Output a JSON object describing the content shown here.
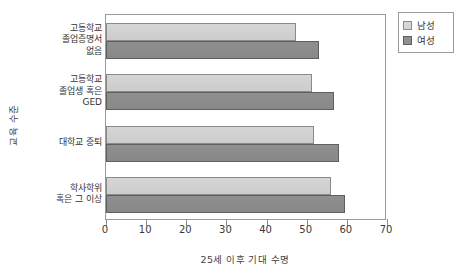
{
  "chart_data": {
    "type": "bar",
    "orientation": "horizontal",
    "title": "",
    "xlabel": "25세 이후 기대 수명",
    "ylabel": "교육 수준",
    "xlim": [
      0,
      70
    ],
    "xticks": [
      0,
      10,
      20,
      30,
      40,
      50,
      60,
      70
    ],
    "xtick_labels": [
      "0",
      "10",
      "20",
      "30",
      "40",
      "50",
      "60",
      "70"
    ],
    "grid": false,
    "legend_position": "outside-top-right",
    "categories": [
      "고등학교\n졸업증명서\n없음",
      "고등학교\n졸업생 혹은\nGED",
      "대학교 중퇴",
      "학사학위\n혹은 그 이상"
    ],
    "series": [
      {
        "name": "남성",
        "color": "#d6d6d6",
        "values": [
          47.3,
          51.3,
          51.8,
          56.1
        ]
      },
      {
        "name": "여성",
        "color": "#8f8f8f",
        "values": [
          53.1,
          56.8,
          58.0,
          59.5
        ]
      }
    ]
  },
  "legend": {
    "items": [
      {
        "label": "남성",
        "swatch": "male"
      },
      {
        "label": "여성",
        "swatch": "female"
      }
    ]
  }
}
